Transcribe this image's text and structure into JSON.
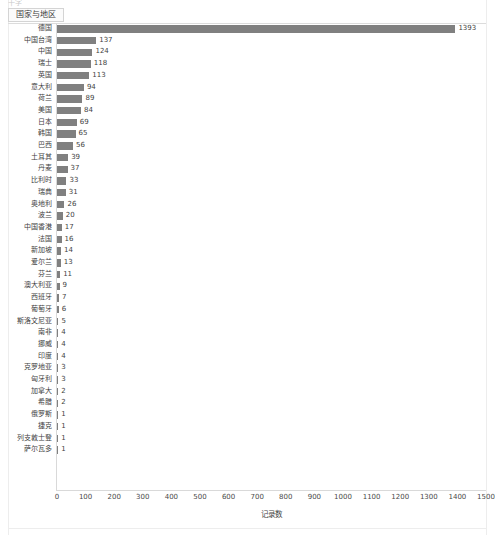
{
  "top_clip_text": "十字",
  "header": {
    "dimension_label": "国家与地区"
  },
  "axis_title": "记录数",
  "colors": {
    "bar": "#808080",
    "axis": "#d9d9d9",
    "text": "#3f3f3f",
    "pill_border": "#d4d4d4"
  },
  "chart_data": {
    "type": "bar",
    "orientation": "horizontal",
    "title": "",
    "xlabel": "记录数",
    "ylabel": "国家与地区",
    "xlim": [
      0,
      1500
    ],
    "xticks": [
      0,
      100,
      200,
      300,
      400,
      500,
      600,
      700,
      800,
      900,
      1000,
      1100,
      1200,
      1300,
      1400,
      1500
    ],
    "grid": false,
    "legend": "none",
    "categories": [
      "德国",
      "中国台湾",
      "中国",
      "瑞士",
      "英国",
      "意大利",
      "荷兰",
      "美国",
      "日本",
      "韩国",
      "巴西",
      "土耳其",
      "丹麦",
      "比利时",
      "瑞典",
      "奥地利",
      "波兰",
      "中国香港",
      "法国",
      "新加坡",
      "爱尔兰",
      "芬兰",
      "澳大利亚",
      "西班牙",
      "葡萄牙",
      "斯洛文尼亚",
      "南非",
      "挪威",
      "印度",
      "克罗地亚",
      "匈牙利",
      "加拿大",
      "希腊",
      "俄罗斯",
      "捷克",
      "列支敦士登",
      "萨尔瓦多"
    ],
    "values": [
      1393,
      137,
      124,
      118,
      113,
      94,
      89,
      84,
      69,
      65,
      56,
      39,
      37,
      33,
      31,
      26,
      20,
      17,
      16,
      14,
      13,
      11,
      9,
      7,
      6,
      5,
      4,
      4,
      4,
      3,
      3,
      2,
      2,
      1,
      1,
      1,
      1
    ]
  }
}
